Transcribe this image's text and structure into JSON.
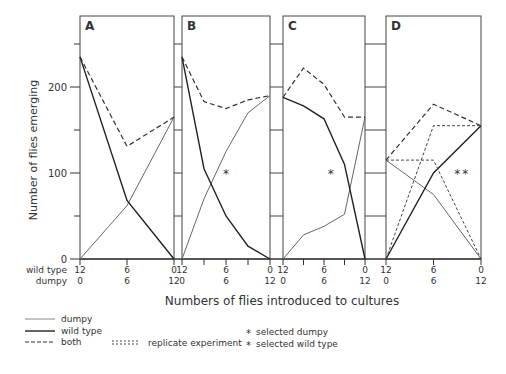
{
  "chart_data": [
    {
      "type": "line",
      "panel": "A",
      "x_wild_type": [
        12,
        6,
        0
      ],
      "x_dumpy": [
        0,
        6,
        12
      ],
      "series": [
        {
          "name": "dumpy",
          "style": "thin solid",
          "values": [
            0,
            62,
            165
          ]
        },
        {
          "name": "wild type",
          "style": "thick solid",
          "values": [
            235,
            68,
            0
          ]
        },
        {
          "name": "both",
          "style": "dashed",
          "values": [
            235,
            131,
            165
          ]
        }
      ]
    },
    {
      "type": "line",
      "panel": "B",
      "x_wild_type": [
        12,
        9,
        6,
        3,
        0
      ],
      "x_dumpy": [
        0,
        3,
        6,
        9,
        12
      ],
      "series": [
        {
          "name": "dumpy",
          "style": "thin solid",
          "values": [
            0,
            70,
            125,
            170,
            190
          ]
        },
        {
          "name": "wild type",
          "style": "thick solid",
          "values": [
            235,
            105,
            50,
            15,
            0
          ]
        },
        {
          "name": "both",
          "style": "dashed",
          "values": [
            235,
            183,
            175,
            185,
            190
          ]
        }
      ],
      "annotations": [
        {
          "symbol": "*",
          "meaning": "selected dumpy",
          "x": 6,
          "y": 100
        }
      ]
    },
    {
      "type": "line",
      "panel": "C",
      "x_wild_type": [
        12,
        9,
        6,
        3,
        0
      ],
      "x_dumpy": [
        0,
        3,
        6,
        9,
        12
      ],
      "series": [
        {
          "name": "dumpy",
          "style": "thin solid",
          "values": [
            0,
            28,
            38,
            52,
            165
          ]
        },
        {
          "name": "wild type",
          "style": "thick solid",
          "values": [
            188,
            178,
            163,
            110,
            0
          ]
        },
        {
          "name": "both",
          "style": "dashed",
          "values": [
            188,
            222,
            203,
            165,
            165
          ]
        }
      ],
      "annotations": [
        {
          "symbol": "*",
          "meaning": "selected wild type",
          "x": 5,
          "y": 100
        }
      ]
    },
    {
      "type": "line",
      "panel": "D",
      "x_wild_type": [
        12,
        6,
        0
      ],
      "x_dumpy": [
        0,
        6,
        12
      ],
      "series": [
        {
          "name": "dumpy",
          "style": "thin solid",
          "values": [
            115,
            75,
            0
          ]
        },
        {
          "name": "wild type",
          "style": "thick solid",
          "values": [
            0,
            100,
            155
          ]
        },
        {
          "name": "both",
          "style": "dashed",
          "values": [
            115,
            180,
            155
          ]
        },
        {
          "name": "dumpy (replicate)",
          "style": "dotted",
          "values": [
            115,
            115,
            0
          ]
        },
        {
          "name": "wild type (replicate)",
          "style": "dotted",
          "values": [
            0,
            155,
            155
          ]
        }
      ],
      "annotations": [
        {
          "symbol": "*",
          "meaning": "selected dumpy",
          "x": 3,
          "y": 100
        },
        {
          "symbol": "*",
          "meaning": "selected wild type",
          "x": 2,
          "y": 100
        }
      ]
    }
  ],
  "ylabel": "Number of flies emerging",
  "xlabel": "Numbers of flies introduced to cultures",
  "ylim": [
    0,
    270
  ],
  "y_ticks": [
    "0",
    "100",
    "200"
  ],
  "x_row_labels": {
    "wild_type": "wild type",
    "dumpy": "dumpy"
  },
  "x_tick_wild": [
    "12",
    "6",
    "0"
  ],
  "x_tick_dumpy": [
    "0",
    "6",
    "12"
  ],
  "panels": [
    "A",
    "B",
    "C",
    "D"
  ],
  "legend": {
    "dumpy": "dumpy",
    "wild_type": "wild type",
    "both": "both",
    "replicate": "replicate experiment",
    "selected_dumpy": "selected dumpy",
    "selected_wild": "selected wild type"
  }
}
